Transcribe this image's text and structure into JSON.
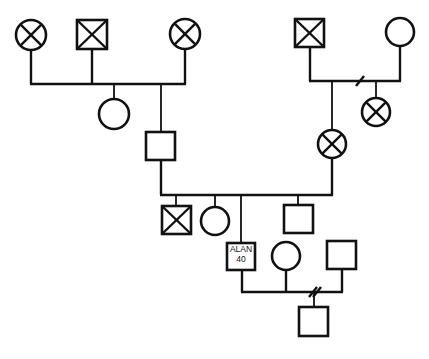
{
  "diagram": {
    "type": "genogram",
    "title": "",
    "legend": {
      "square": "male",
      "circle": "female",
      "crossed": "deceased",
      "double_slash": "divorced / separated"
    },
    "colors": {
      "line": "#111111",
      "background": "#ffffff"
    },
    "individuals": [
      {
        "id": "p1",
        "sex": "female",
        "deceased": true,
        "label": ""
      },
      {
        "id": "p2",
        "sex": "male",
        "deceased": true,
        "label": ""
      },
      {
        "id": "p3",
        "sex": "female",
        "deceased": true,
        "label": ""
      },
      {
        "id": "p4",
        "sex": "female",
        "deceased": false,
        "label": ""
      },
      {
        "id": "p5",
        "sex": "male",
        "deceased": false,
        "label": ""
      },
      {
        "id": "p6",
        "sex": "male",
        "deceased": true,
        "label": ""
      },
      {
        "id": "p7",
        "sex": "female",
        "deceased": false,
        "label": ""
      },
      {
        "id": "p8",
        "sex": "female",
        "deceased": true,
        "label": ""
      },
      {
        "id": "p9",
        "sex": "female",
        "deceased": true,
        "label": ""
      },
      {
        "id": "p10",
        "sex": "male",
        "deceased": true,
        "label": ""
      },
      {
        "id": "p11",
        "sex": "female",
        "deceased": false,
        "label": ""
      },
      {
        "id": "p12",
        "sex": "male",
        "deceased": false,
        "label": ""
      },
      {
        "id": "alan",
        "sex": "male",
        "deceased": false,
        "name": "ALAN",
        "age": "40"
      },
      {
        "id": "p14",
        "sex": "female",
        "deceased": false,
        "label": ""
      },
      {
        "id": "p15",
        "sex": "male",
        "deceased": false,
        "label": ""
      },
      {
        "id": "p16",
        "sex": "male",
        "deceased": false,
        "label": ""
      }
    ],
    "relationships": [
      {
        "partners": [
          "p1",
          "p2",
          "p3"
        ],
        "status": "married",
        "children": [
          "p4",
          "p5"
        ]
      },
      {
        "partners": [
          "p6",
          "p7"
        ],
        "status": "divorced",
        "children": [
          "p8",
          "p9"
        ]
      },
      {
        "partners": [
          "p5",
          "p9"
        ],
        "status": "married",
        "children": [
          "p10",
          "p11",
          "alan",
          "p12"
        ]
      },
      {
        "partners": [
          "alan",
          "p14",
          "p15"
        ],
        "status": "divorced",
        "children": [
          "p16"
        ]
      }
    ],
    "proband": {
      "name": "ALAN",
      "age": "40"
    }
  }
}
